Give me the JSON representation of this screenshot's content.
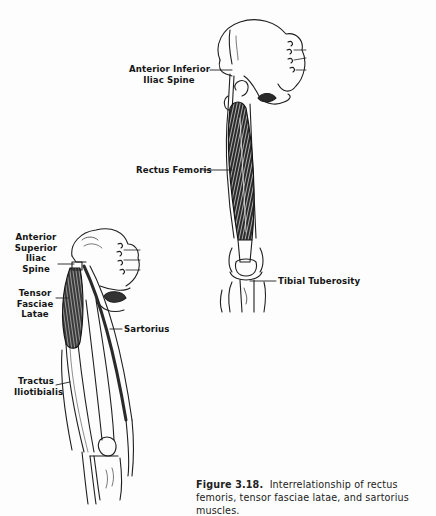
{
  "figure": {
    "number": "Figure 3.18.",
    "caption": "Interrelationship of rectus femoris, tensor fasciae latae, and sartorius muscles."
  },
  "upper_illustration": {
    "subject": "rectus femoris, anterior view of right thigh",
    "labels": {
      "anterior_inferior_iliac_spine": [
        "Anterior Inferior",
        "Iliac Spine"
      ],
      "rectus_femoris": "Rectus Femoris",
      "tibial_tuberosity": "Tibial Tuberosity"
    }
  },
  "lower_illustration": {
    "subject": "tensor fasciae latae and sartorius, anterolateral view of thigh",
    "labels": {
      "anterior_superior_iliac_spine": [
        "Anterior",
        "Superior",
        "Iliac",
        "Spine"
      ],
      "tensor_fasciae_latae": [
        "Tensor",
        "Fasciae",
        "Latae"
      ],
      "sartorius": "Sartorius",
      "tractus_iliotibialis": [
        "Tractus",
        "Iliotibialis"
      ]
    }
  },
  "colors": {
    "ink": "#1a1a1a",
    "paper": "#fdfdfd"
  }
}
